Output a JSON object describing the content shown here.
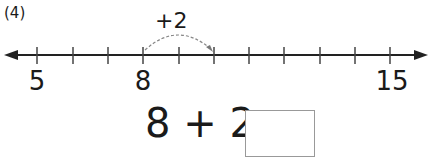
{
  "problem": {
    "number_label": "(4)",
    "jump_label": "+2",
    "equation_left": "8 + 2 =",
    "answer_value": ""
  },
  "number_line": {
    "start": 4,
    "end": 15,
    "labeled_ticks": [
      {
        "value": "5",
        "x": 37
      },
      {
        "value": "8",
        "x": 143
      },
      {
        "value": "15",
        "x": 390
      }
    ],
    "jump_from": 8,
    "jump_to": 10
  }
}
